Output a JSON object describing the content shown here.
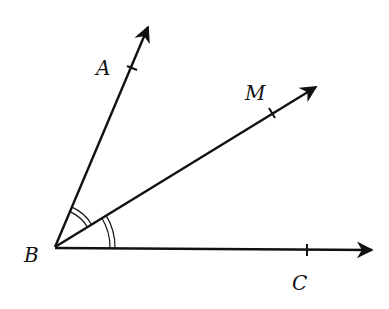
{
  "diagram": {
    "type": "angle-bisector",
    "stroke_color": "#111111",
    "background": "#ffffff",
    "vertex": {
      "label": "B",
      "x": 55,
      "y": 247,
      "label_x": 24,
      "label_y": 262
    },
    "rays": [
      {
        "name": "BA",
        "end_x": 148,
        "end_y": 27,
        "point": {
          "label": "A",
          "x": 132,
          "y": 68,
          "label_x": 96,
          "label_y": 75
        }
      },
      {
        "name": "BM",
        "end_x": 316,
        "end_y": 87,
        "point": {
          "label": "M",
          "x": 272,
          "y": 113,
          "label_x": 245,
          "label_y": 100
        }
      },
      {
        "name": "BC",
        "end_x": 372,
        "end_y": 250,
        "point": {
          "label": "C",
          "x": 307,
          "y": 250,
          "label_x": 292,
          "label_y": 290
        }
      }
    ],
    "angle_marks": [
      {
        "between": [
          "BA",
          "BM"
        ],
        "style": "double-arc",
        "radii": [
          20,
          24
        ]
      },
      {
        "between": [
          "BM",
          "BC"
        ],
        "style": "double-arc",
        "radii": [
          60,
          64
        ]
      }
    ]
  }
}
